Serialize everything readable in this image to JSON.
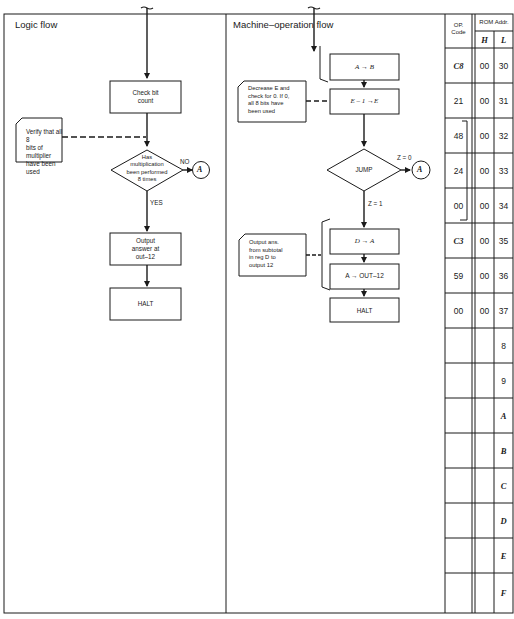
{
  "logic_flow": {
    "title": "Logic flow",
    "check_bit_box": [
      "Check bit",
      "count"
    ],
    "note_verify": [
      "Verify that all 8",
      "bits of multiplier",
      "have been used"
    ],
    "decision": [
      "Has",
      "multiplication",
      "been performed",
      "8 times"
    ],
    "decision_no_label": "NO",
    "decision_yes_label": "YES",
    "connector_label": "A",
    "output_box": [
      "Output",
      "answer at",
      "out–12"
    ],
    "halt_box": "HALT"
  },
  "machine_flow": {
    "title": "Machine–operation flow",
    "box_a_to_b": "A → B",
    "box_e_dec": "E – 1 →E",
    "note_decrease": [
      "Decrease E and",
      "check for 0. If 0,",
      "all 8 bits have",
      "been used"
    ],
    "jump_box": "JUMP",
    "jump_z0_label": "Z = 0",
    "jump_z1_label": "Z = 1",
    "connector_label": "A",
    "box_d_to_a": "D → A",
    "box_a_to_out": "A → OUT–12",
    "note_output": [
      "Output ans.",
      "from subtotal",
      "in reg D to",
      "output 12"
    ],
    "halt_box": "HALT"
  },
  "table": {
    "header_op": [
      "OP.",
      "Code"
    ],
    "header_rom": "ROM Addr.",
    "header_h": "H",
    "header_l": "L",
    "rows": [
      {
        "op": "C8",
        "h": "00",
        "l": "30"
      },
      {
        "op": "21",
        "h": "00",
        "l": "31"
      },
      {
        "op": "48",
        "h": "00",
        "l": "32"
      },
      {
        "op": "24",
        "h": "00",
        "l": "33"
      },
      {
        "op": "00",
        "h": "00",
        "l": "34"
      },
      {
        "op": "C3",
        "h": "00",
        "l": "35"
      },
      {
        "op": "59",
        "h": "00",
        "l": "36"
      },
      {
        "op": "00",
        "h": "00",
        "l": "37"
      },
      {
        "op": "",
        "h": "",
        "l": "8"
      },
      {
        "op": "",
        "h": "",
        "l": "9"
      },
      {
        "op": "",
        "h": "",
        "l": "A"
      },
      {
        "op": "",
        "h": "",
        "l": "B"
      },
      {
        "op": "",
        "h": "",
        "l": "C"
      },
      {
        "op": "",
        "h": "",
        "l": "D"
      },
      {
        "op": "",
        "h": "",
        "l": "E"
      },
      {
        "op": "",
        "h": "",
        "l": "F"
      }
    ]
  }
}
